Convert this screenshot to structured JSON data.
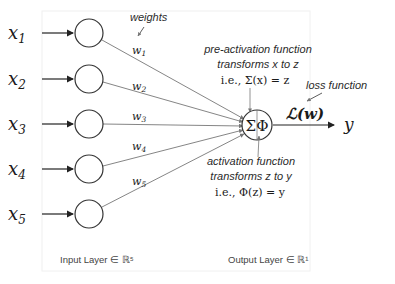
{
  "diagram": {
    "title_annotation": "weights",
    "inputs": [
      {
        "var": "x",
        "sub": "1",
        "weight": "w",
        "wsub": "1"
      },
      {
        "var": "x",
        "sub": "2",
        "weight": "w",
        "wsub": "2"
      },
      {
        "var": "x",
        "sub": "3",
        "weight": "w",
        "wsub": "3"
      },
      {
        "var": "x",
        "sub": "4",
        "weight": "w",
        "wsub": "4"
      },
      {
        "var": "x",
        "sub": "5",
        "weight": "w",
        "wsub": "5"
      }
    ],
    "neuron_symbol": "ΣΦ",
    "output_var": "y",
    "loss_symbol": "ℒ(w)",
    "pre_activation": {
      "line1": "pre-activation function",
      "line2": "transforms x to z",
      "line3": "i.e., Σ(x) = z"
    },
    "loss_label": "loss function",
    "activation": {
      "line1": "activation function",
      "line2": "transforms z to y",
      "line3": "i.e., Φ(z) = y"
    },
    "input_layer_label": "Input Layer ∈ ℝ⁵",
    "output_layer_label": "Output Layer ∈ ℝ¹"
  }
}
